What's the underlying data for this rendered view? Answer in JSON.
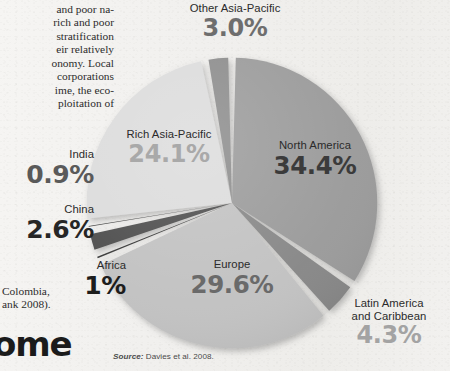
{
  "document": {
    "left_column_top_lines": [
      "and poor na-",
      "rich and poor",
      "stratification",
      "eir relatively",
      "onomy. Local",
      "corporations",
      "ime, the eco-",
      "ploitation of"
    ],
    "left_column_bottom_lines": [
      "Colombia,",
      "ank 2008)."
    ],
    "headline_fragment": "ome"
  },
  "source": {
    "label": "Source:",
    "citation": "Davies et al. 2008."
  },
  "labels": {
    "other_asia_pacific": {
      "name": "Other Asia-Pacific",
      "pct": "3.0%"
    },
    "north_america": {
      "name": "North America",
      "pct": "34.4%"
    },
    "rich_asia_pacific": {
      "name": "Rich Asia-Pacific",
      "pct": "24.1%"
    },
    "europe": {
      "name": "Europe",
      "pct": "29.6%"
    },
    "latin_america": {
      "name_line1": "Latin America",
      "name_line2": "and Caribbean",
      "pct": "4.3%"
    },
    "india": {
      "name": "India",
      "pct": "0.9%"
    },
    "china": {
      "name": "China",
      "pct": "2.6%"
    },
    "africa": {
      "name": "Africa",
      "pct": "1%"
    }
  },
  "chart_data": {
    "type": "pie",
    "title": "",
    "subtitle": "",
    "xlabel": "",
    "ylabel": "",
    "grid": false,
    "legend": "none (direct slice labels)",
    "units": "percent of world total",
    "source": "Davies et al. 2008.",
    "start_angle_deg": 0,
    "direction": "clockwise",
    "categories": [
      "North America",
      "Latin America and Caribbean",
      "Europe",
      "Africa",
      "China",
      "India",
      "Rich Asia-Pacific",
      "Other Asia-Pacific"
    ],
    "values": [
      34.4,
      4.3,
      29.6,
      1.0,
      2.6,
      0.9,
      24.1,
      3.0
    ],
    "labels_shown": [
      "34.4%",
      "4.3%",
      "29.6%",
      "1%",
      "2.6%",
      "0.9%",
      "24.1%",
      "3.0%"
    ],
    "slice_colors": [
      "#9b9b9b",
      "#888888",
      "#c2c2c2",
      "#3a3a3a",
      "#4f4f4f",
      "#414141",
      "#dcdcdc",
      "#8d8d8d"
    ],
    "total": 99.9,
    "separator_color": "#ffffff"
  },
  "colors": {
    "page_background": "#f3f2f0",
    "body_text": "#2c2c2c",
    "label_text": "#2b2b2b",
    "headline": "#1b1b1b"
  }
}
